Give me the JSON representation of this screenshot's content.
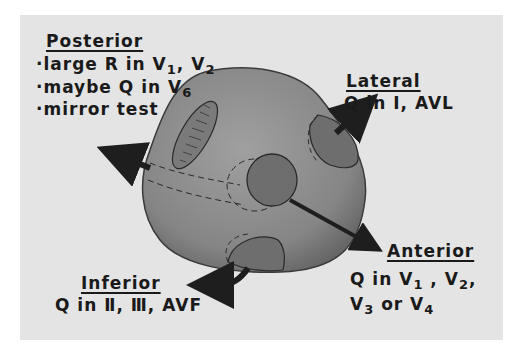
{
  "diagram": {
    "regions": {
      "posterior": {
        "title": "Posterior",
        "bullets": [
          {
            "prefix": "·large R in V",
            "sub1": "1",
            "mid": ", V",
            "sub2": "2"
          },
          {
            "prefix": "·maybe Q in V",
            "sub1": "6"
          },
          {
            "prefix": "·mirror test"
          }
        ]
      },
      "lateral": {
        "title": "Lateral",
        "line": "Q in I, AVL"
      },
      "anterior": {
        "title": "Anterior",
        "line1": {
          "a": "Q in V",
          "s1": "1",
          "b": " , V",
          "s2": "2",
          "c": ","
        },
        "line2": {
          "a": "V",
          "s1": "3",
          "b": " or V",
          "s2": "4"
        }
      },
      "inferior": {
        "title": "Inferior",
        "line": "Q in Ⅱ, Ⅲ, AVF"
      }
    },
    "colors": {
      "background": "#e4e4e4",
      "heart": "#8a8a8a",
      "region": "#6e6e6e",
      "arrow": "#1e1e1e",
      "text": "#1a1a1a"
    }
  }
}
